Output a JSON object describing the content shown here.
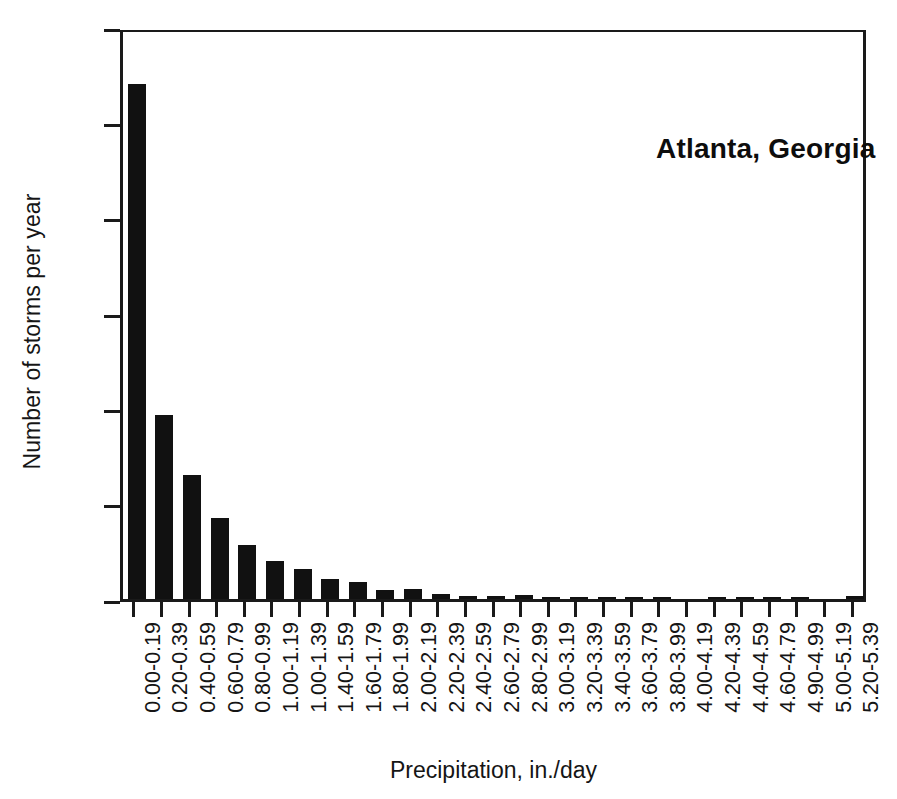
{
  "chart_data": {
    "type": "bar",
    "title": "Atlanta, Georgia",
    "xlabel": "Precipitation, in./day",
    "ylabel": "Number of storms per year",
    "grid": false,
    "legend": null,
    "ylim": [
      0,
      60
    ],
    "yticks": [
      0,
      10,
      20,
      30,
      40,
      50,
      60
    ],
    "ytick_labels": [
      "0",
      "10",
      "20",
      "30",
      "40",
      "50",
      "60"
    ],
    "categories": [
      "0.00-0.19",
      "0.20-0.39",
      "0.40-0.59",
      "0.60-0.79",
      "0.80-0.99",
      "1.00-1.19",
      "1.00-1.39",
      "1.40-1.59",
      "1.60-1.79",
      "1.80-1.99",
      "2.00-2.19",
      "2.20-2.39",
      "2.40-2.59",
      "2.60-2.79",
      "2.80-2.99",
      "3.00-3.19",
      "3.20-3.39",
      "3.40-3.59",
      "3.60-3.79",
      "3.80-3.99",
      "4.00-4.19",
      "4.20-4.39",
      "4.40-4.59",
      "4.60-4.79",
      "4.90-4.99",
      "5.00-5.19",
      "5.20-5.39"
    ],
    "values": [
      54.0,
      19.3,
      13.0,
      8.5,
      5.7,
      4.0,
      3.2,
      2.1,
      1.8,
      0.9,
      1.1,
      0.5,
      0.3,
      0.3,
      0.4,
      0.15,
      0.15,
      0.15,
      0.15,
      0.12,
      0.0,
      0.15,
      0.15,
      0.15,
      0.2,
      0.0,
      0.3
    ]
  },
  "colors": {
    "bar": "#111111",
    "axis": "#1a1a1a",
    "text": "#151515",
    "background": "#ffffff"
  }
}
